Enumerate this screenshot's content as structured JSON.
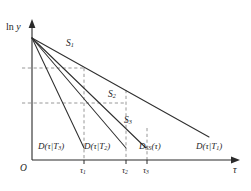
{
  "figure": {
    "name": "semilog-decay-diagram",
    "background_color": "#ffffff",
    "line_color": "#2f2f2f",
    "guide_color": "#8c8c8c",
    "axis_color": "#2a2a2a"
  },
  "axes": {
    "y_label_prefix": "ln",
    "y_label_var": "y",
    "x_label": "τ",
    "origin_label": "O",
    "y_arrow": "up",
    "x_arrow": "right"
  },
  "ticks": {
    "x": [
      {
        "label_var": "τ",
        "label_sub": "1",
        "x": 84
      },
      {
        "label_var": "τ",
        "label_sub": "2",
        "x": 126
      },
      {
        "label_var": "τ",
        "label_sub": "3",
        "x": 147
      }
    ]
  },
  "curve_labels": [
    {
      "name": "S1",
      "var": "S",
      "sub": "1"
    },
    {
      "name": "S2",
      "var": "S",
      "sub": "2"
    },
    {
      "name": "S3",
      "var": "S",
      "sub": "3"
    }
  ],
  "end_labels": [
    {
      "name": "D-tau-given-T3",
      "text_prefix": "D(",
      "var1": "τ",
      "bar": "|",
      "var2": "T",
      "sub": "3",
      "text_suffix": ")"
    },
    {
      "name": "D-tau-given-T2",
      "text_prefix": "D(",
      "var1": "τ",
      "bar": "|",
      "var2": "T",
      "sub": "2",
      "text_suffix": ")"
    },
    {
      "name": "D-SS-tau",
      "text_prefix": "D",
      "var1": "",
      "bar": "",
      "var2": "",
      "sub": "SS",
      "text_suffix": "(τ)"
    },
    {
      "name": "D-tau-given-T1",
      "text_prefix": "D(",
      "var1": "τ",
      "bar": "|",
      "var2": "T",
      "sub": "1",
      "text_suffix": ")"
    }
  ],
  "chart_data": {
    "type": "line",
    "title": "",
    "xlabel": "τ",
    "ylabel": "ln y",
    "grid": false,
    "legend": "inline-curve-labels",
    "origin_point": {
      "x": 32,
      "y": 38
    },
    "xlim": [
      0,
      251
    ],
    "ylim_pixels": [
      38,
      152
    ],
    "series": [
      {
        "name": "D(τ|T₁)",
        "curve_label": "S₁",
        "slope_rank": 1,
        "start": {
          "x": 32,
          "y": 38
        },
        "end": {
          "x": 209,
          "y": 137
        },
        "points": [
          [
            32,
            38
          ],
          [
            84,
            67
          ],
          [
            126,
            90
          ],
          [
            147,
            102
          ],
          [
            209,
            137
          ]
        ]
      },
      {
        "name": "D_SS(τ)",
        "curve_label": "S₂",
        "slope_rank": 2,
        "start": {
          "x": 32,
          "y": 38
        },
        "end": {
          "x": 146,
          "y": 148
        },
        "points": [
          [
            32,
            38
          ],
          [
            84,
            88
          ],
          [
            126,
            128
          ],
          [
            146,
            148
          ]
        ]
      },
      {
        "name": "D(τ|T₂)",
        "curve_label": "S₃",
        "slope_rank": 3,
        "start": {
          "x": 32,
          "y": 38
        },
        "end": {
          "x": 126,
          "y": 148
        },
        "points": [
          [
            32,
            38
          ],
          [
            84,
            99
          ],
          [
            126,
            148
          ]
        ]
      },
      {
        "name": "D(τ|T₃)",
        "curve_label": "",
        "slope_rank": 4,
        "start": {
          "x": 32,
          "y": 38
        },
        "end": {
          "x": 84,
          "y": 148
        },
        "points": [
          [
            32,
            38
          ],
          [
            84,
            148
          ]
        ]
      }
    ],
    "guides": {
      "horizontal": [
        {
          "y": 68,
          "x_from": 22,
          "x_to": 84,
          "meaning": "ln y level at τ₁ on S₁"
        },
        {
          "y": 103,
          "x_from": 22,
          "x_to": 126,
          "meaning": "ln y level at τ₂"
        }
      ],
      "vertical": [
        {
          "x": 84,
          "y_from": 68,
          "y_to": 160,
          "tick": "τ₁"
        },
        {
          "x": 126,
          "y_from": 90,
          "y_to": 160,
          "tick": "τ₂"
        },
        {
          "x": 147,
          "y_from": 128,
          "y_to": 160,
          "tick": "τ₃"
        }
      ]
    }
  }
}
